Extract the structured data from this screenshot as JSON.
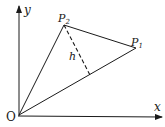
{
  "diagram": {
    "type": "geometry",
    "colors": {
      "stroke": "#1a1a1a",
      "background": "#ffffff"
    },
    "axes": {
      "x_label": "x",
      "y_label": "y",
      "origin_label": "O"
    },
    "points": {
      "origin": {
        "label": "O",
        "pos": [
          19,
          115
        ]
      },
      "p1": {
        "label": "P",
        "sub": "1",
        "pos": [
          136,
          48
        ]
      },
      "p2": {
        "label": "P",
        "sub": "2",
        "pos": [
          64,
          25
        ]
      },
      "foot": {
        "pos": [
          90,
          75
        ]
      }
    },
    "segments": [
      {
        "from": "O",
        "to": "P1",
        "style": "solid"
      },
      {
        "from": "O",
        "to": "P2",
        "style": "solid"
      },
      {
        "from": "P2",
        "to": "P1",
        "style": "solid"
      },
      {
        "from": "P2",
        "to": "foot",
        "style": "dashed",
        "label": "h"
      }
    ],
    "height_label": "h"
  }
}
